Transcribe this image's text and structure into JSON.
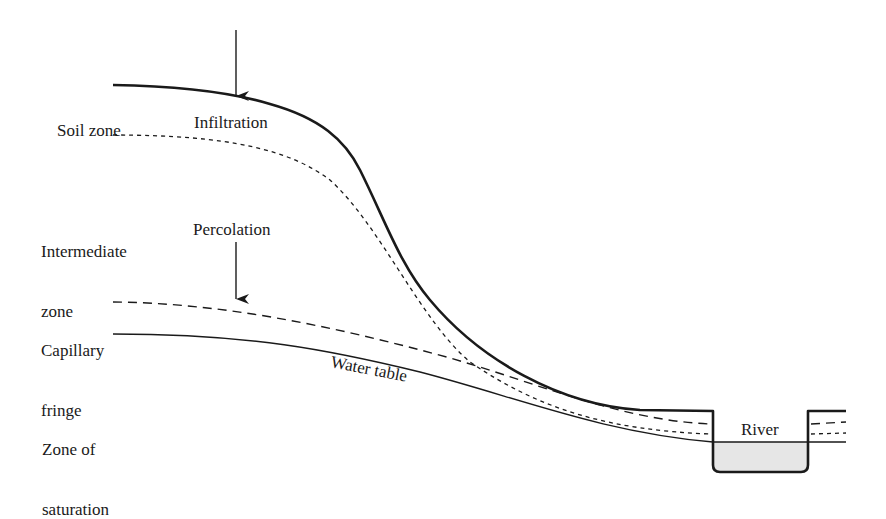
{
  "diagram": {
    "type": "hydrogeologic cross-section",
    "zone_labels": [
      {
        "id": "soil-zone",
        "lines": [
          "Soil zone"
        ]
      },
      {
        "id": "intermediate-zone",
        "lines": [
          "Intermediate",
          "zone"
        ]
      },
      {
        "id": "capillary-fringe",
        "lines": [
          "Capillary",
          "fringe"
        ]
      },
      {
        "id": "zone-of-saturation",
        "lines": [
          "Zone of",
          "saturation"
        ]
      }
    ],
    "process_labels": {
      "infiltration": "Infiltration",
      "percolation": "Percolation"
    },
    "line_labels": {
      "water_table": "Water table"
    },
    "feature_labels": {
      "river": "River"
    },
    "colors": {
      "ink": "#1a1a1a",
      "river_fill": "#e6e6e6",
      "background": "#ffffff"
    }
  }
}
